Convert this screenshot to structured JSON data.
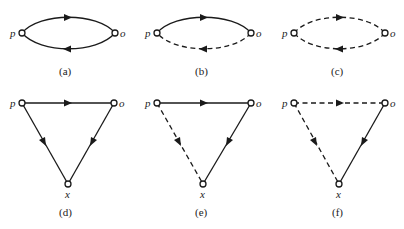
{
  "diagram": {
    "panels": [
      {
        "id": "a",
        "caption": "(a)",
        "nodes": [
          {
            "label": "p"
          },
          {
            "label": "o"
          }
        ],
        "edges": [
          {
            "from": "p",
            "to": "o",
            "style": "solid",
            "route": "upper-arc"
          },
          {
            "from": "o",
            "to": "p",
            "style": "solid",
            "route": "lower-arc"
          }
        ]
      },
      {
        "id": "b",
        "caption": "(b)",
        "nodes": [
          {
            "label": "p"
          },
          {
            "label": "o"
          }
        ],
        "edges": [
          {
            "from": "p",
            "to": "o",
            "style": "solid",
            "route": "upper-arc"
          },
          {
            "from": "o",
            "to": "p",
            "style": "dashed",
            "route": "lower-arc"
          }
        ]
      },
      {
        "id": "c",
        "caption": "(c)",
        "nodes": [
          {
            "label": "p"
          },
          {
            "label": "o"
          }
        ],
        "edges": [
          {
            "from": "p",
            "to": "o",
            "style": "dashed",
            "route": "upper-arc"
          },
          {
            "from": "o",
            "to": "p",
            "style": "dashed",
            "route": "lower-arc"
          }
        ]
      },
      {
        "id": "d",
        "caption": "(d)",
        "nodes": [
          {
            "label": "p"
          },
          {
            "label": "o"
          },
          {
            "label": "x"
          }
        ],
        "edges": [
          {
            "from": "p",
            "to": "o",
            "style": "solid"
          },
          {
            "from": "p",
            "to": "x",
            "style": "solid"
          },
          {
            "from": "o",
            "to": "x",
            "style": "solid"
          }
        ]
      },
      {
        "id": "e",
        "caption": "(e)",
        "nodes": [
          {
            "label": "p"
          },
          {
            "label": "o"
          },
          {
            "label": "x"
          }
        ],
        "edges": [
          {
            "from": "p",
            "to": "o",
            "style": "solid"
          },
          {
            "from": "p",
            "to": "x",
            "style": "dashed"
          },
          {
            "from": "o",
            "to": "x",
            "style": "solid"
          }
        ]
      },
      {
        "id": "f",
        "caption": "(f)",
        "nodes": [
          {
            "label": "p"
          },
          {
            "label": "o"
          },
          {
            "label": "x"
          }
        ],
        "edges": [
          {
            "from": "p",
            "to": "o",
            "style": "dashed"
          },
          {
            "from": "p",
            "to": "x",
            "style": "dashed"
          },
          {
            "from": "o",
            "to": "x",
            "style": "solid"
          }
        ]
      }
    ]
  }
}
